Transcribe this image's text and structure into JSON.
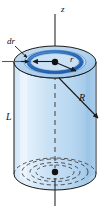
{
  "figure": {
    "kind": "physics-diagram",
    "caption": "",
    "labels": {
      "axis_z": "z",
      "shell_thickness": "dr",
      "shell_radius": "r",
      "cylinder_radius": "R",
      "cylinder_length": "L"
    },
    "colors": {
      "background": "#ffffff",
      "body_fill_light": "#d7e9f9",
      "body_fill_mid": "#bcd9f2",
      "body_fill_shadow": "#9dc6e8",
      "top_face_fill": "#b3d4ef",
      "top_face_inner_fill": "#cfe4f6",
      "annulus_fill": "#2f6fc0",
      "annulus_highlight": "#5a97d8",
      "outline": "#1a1a1a",
      "dashed_line": "#4a4a4a",
      "axis_line": "#2b2b2b",
      "label_text": "#111111",
      "arrow": "#1a1a1a"
    },
    "geometry": {
      "cylinder_center_x": 55,
      "top_face_center_y": 62,
      "bottom_face_center_y": 174,
      "outer_radius_x": 41,
      "outer_radius_y": 16,
      "shell_radius_x": 27,
      "shell_radius_y": 10,
      "shell_inner_radius_x": 23,
      "shell_inner_radius_y": 8.5,
      "axis_top_y": 14,
      "axis_bottom_y": 205
    },
    "elements": [
      "z-axis vertical line through cylinder center, extending above and below the body",
      "cylinder lateral surface with light blue gradient shading",
      "elliptical top face drawn in perspective",
      "dark blue annular ring (shell) of radius r and thickness dr on top face",
      "center dot marking the axis on the top face",
      "double-headed horizontal arrow from center to inner edge of ring labelled r",
      "small arrow pair marking the ring thickness dr with leader line",
      "arrow from interior to lower-right rim labelled R",
      "L label at left marking the cylinder height",
      "dashed vertical axis segment inside the cylinder",
      "dashed concentric ellipses on the hidden bottom face with a center dot"
    ]
  }
}
